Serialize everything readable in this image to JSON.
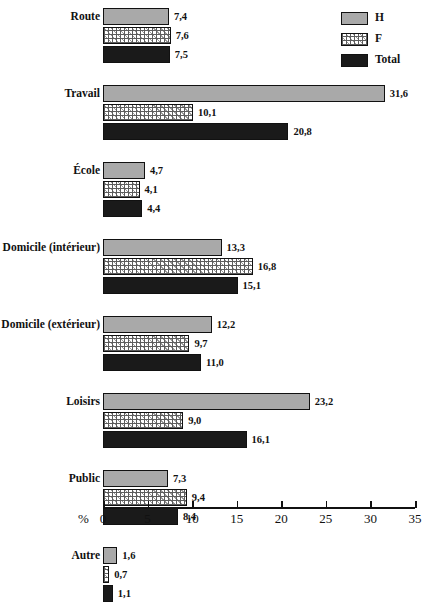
{
  "chart_data": {
    "type": "bar",
    "orientation": "horizontal",
    "title": "",
    "xlabel": "%",
    "ylabel": "",
    "xlim": [
      0,
      35
    ],
    "xticks": [
      0,
      5,
      10,
      15,
      20,
      25,
      30,
      35
    ],
    "grid": false,
    "legend_position": "top-right",
    "categories": [
      "Route",
      "Travail",
      "École",
      "Domicile (intérieur)",
      "Domicile (extérieur)",
      "Loisirs",
      "Public",
      "Autre"
    ],
    "series": [
      {
        "name": "H",
        "color": "#a9a9a9",
        "pattern": "solid-gray",
        "values": [
          7.4,
          31.6,
          4.7,
          13.3,
          12.2,
          23.2,
          7.3,
          1.6
        ],
        "labels": [
          "7,4",
          "31,6",
          "4,7",
          "13,3",
          "12,2",
          "23,2",
          "7,3",
          "1,6"
        ]
      },
      {
        "name": "F",
        "color": "#ffffff",
        "pattern": "cross-hatch",
        "values": [
          7.6,
          10.1,
          4.1,
          16.8,
          9.7,
          9.0,
          9.4,
          0.7
        ],
        "labels": [
          "7,6",
          "10,1",
          "4,1",
          "16,8",
          "9,7",
          "9,0",
          "9,4",
          "0,7"
        ]
      },
      {
        "name": "Total",
        "color": "#1a1a1a",
        "pattern": "solid-black",
        "values": [
          7.5,
          20.8,
          4.4,
          15.1,
          11.0,
          16.1,
          8.4,
          1.1
        ],
        "labels": [
          "7,5",
          "20,8",
          "4,4",
          "15,1",
          "11,0",
          "16,1",
          "8,4",
          "1,1"
        ]
      }
    ]
  },
  "legend": {
    "items": [
      {
        "label": "H",
        "swatch": "fill-H"
      },
      {
        "label": "F",
        "swatch": "fill-F"
      },
      {
        "label": "Total",
        "swatch": "fill-Total"
      }
    ]
  },
  "axis": {
    "unit_label": "%",
    "tick_labels": [
      "0",
      "5",
      "10",
      "15",
      "20",
      "25",
      "30",
      "35"
    ]
  },
  "colors": {
    "series_h": "#a9a9a9",
    "series_f": "#ffffff",
    "series_total": "#1a1a1a",
    "outline": "#111111",
    "background": "#ffffff"
  }
}
